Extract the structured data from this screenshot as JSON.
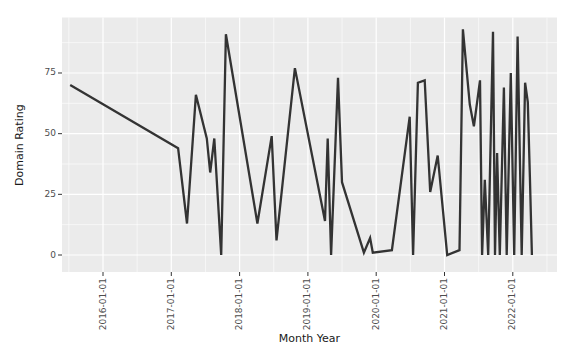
{
  "chart_data": {
    "type": "line",
    "title": "",
    "xlabel": "Month Year",
    "ylabel": "Domain Rating",
    "legend": "none",
    "grid": {
      "major": true,
      "minor": true,
      "color": "#ffffff"
    },
    "panel_bg": "#ebebeb",
    "axis_text_color": "#4d4d4d",
    "axis_title_color": "#1a1a1a",
    "tick_mark_color": "#333333",
    "xlim": [
      2015.37,
      2022.65
    ],
    "ylim": [
      -7,
      98
    ],
    "x_ticks": [
      {
        "year": 2016,
        "label": "2016-01-01"
      },
      {
        "year": 2017,
        "label": "2017-01-01"
      },
      {
        "year": 2018,
        "label": "2018-01-01"
      },
      {
        "year": 2019,
        "label": "2019-01-01"
      },
      {
        "year": 2020,
        "label": "2020-01-01"
      },
      {
        "year": 2021,
        "label": "2021-01-01"
      },
      {
        "year": 2022,
        "label": "2022-01-01"
      }
    ],
    "x_minor_ticks": [
      2015.5,
      2016.5,
      2017.5,
      2018.5,
      2019.5,
      2020.5,
      2021.5,
      2022.5
    ],
    "y_ticks": [
      {
        "value": 0,
        "label": "0"
      },
      {
        "value": 25,
        "label": "25"
      },
      {
        "value": 50,
        "label": "50"
      },
      {
        "value": 75,
        "label": "75"
      }
    ],
    "y_minor_ticks": [
      12.5,
      37.5,
      62.5,
      87.5
    ],
    "series": [
      {
        "name": "Domain Rating",
        "color": "#333333",
        "stroke_width": 2.3,
        "points": [
          [
            2015.52,
            70
          ],
          [
            2017.1,
            44
          ],
          [
            2017.23,
            13
          ],
          [
            2017.36,
            66
          ],
          [
            2017.52,
            48
          ],
          [
            2017.57,
            34
          ],
          [
            2017.63,
            48
          ],
          [
            2017.73,
            0
          ],
          [
            2017.8,
            91
          ],
          [
            2018.26,
            13
          ],
          [
            2018.47,
            49
          ],
          [
            2018.54,
            6
          ],
          [
            2018.81,
            77
          ],
          [
            2019.25,
            14
          ],
          [
            2019.29,
            48
          ],
          [
            2019.34,
            0
          ],
          [
            2019.44,
            73
          ],
          [
            2019.5,
            30
          ],
          [
            2019.82,
            1
          ],
          [
            2019.91,
            7
          ],
          [
            2019.95,
            1
          ],
          [
            2020.23,
            2
          ],
          [
            2020.49,
            57
          ],
          [
            2020.54,
            0
          ],
          [
            2020.61,
            71
          ],
          [
            2020.71,
            72
          ],
          [
            2020.79,
            26
          ],
          [
            2020.9,
            41
          ],
          [
            2021.04,
            0
          ],
          [
            2021.22,
            2
          ],
          [
            2021.27,
            93
          ],
          [
            2021.37,
            62
          ],
          [
            2021.43,
            53
          ],
          [
            2021.52,
            72
          ],
          [
            2021.55,
            0
          ],
          [
            2021.59,
            31
          ],
          [
            2021.64,
            0
          ],
          [
            2021.71,
            92
          ],
          [
            2021.74,
            0
          ],
          [
            2021.77,
            42
          ],
          [
            2021.81,
            0
          ],
          [
            2021.87,
            69
          ],
          [
            2021.91,
            0
          ],
          [
            2021.97,
            75
          ],
          [
            2022.02,
            0
          ],
          [
            2022.07,
            90
          ],
          [
            2022.13,
            0
          ],
          [
            2022.18,
            71
          ],
          [
            2022.22,
            63
          ],
          [
            2022.25,
            32
          ],
          [
            2022.28,
            0
          ]
        ]
      }
    ]
  }
}
